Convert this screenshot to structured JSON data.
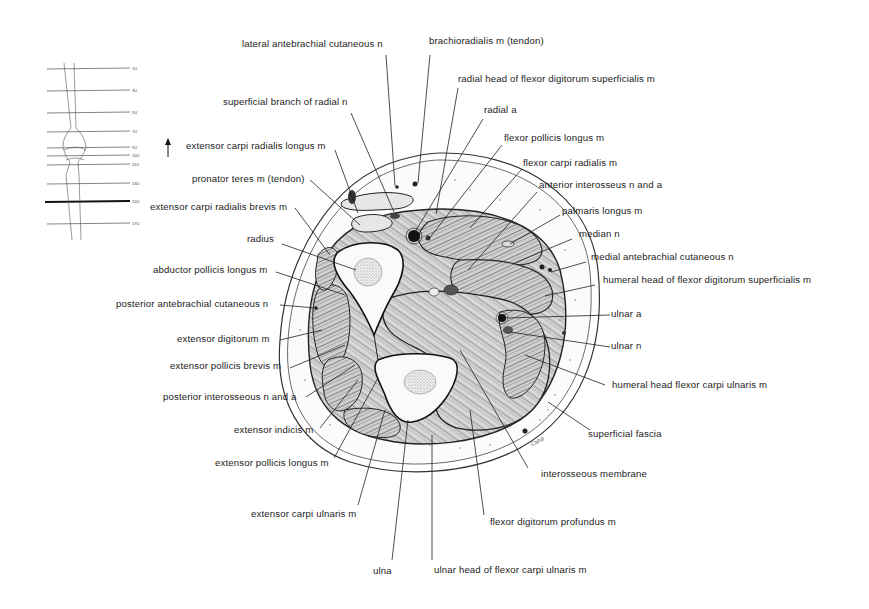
{
  "figure": {
    "type": "anatomical cross-section",
    "signature": "Cahill"
  },
  "orientation_thumbnail": {
    "levels": [
      "1U",
      "3U",
      "5U",
      "7U",
      "9U",
      "10U",
      "11U",
      "13U",
      "15U",
      "17U"
    ],
    "highlighted_level": "15U",
    "arrow": "up-arrow"
  },
  "labels": {
    "top": [
      {
        "text": "lateral antebrachial cutaneous n"
      },
      {
        "text": "brachioradialis m (tendon)"
      },
      {
        "text": "radial head of flexor digitorum superficialis m"
      },
      {
        "text": "superficial branch of radial n"
      },
      {
        "text": "radial a"
      }
    ],
    "right": [
      {
        "text": "flexor pollicis longus m"
      },
      {
        "text": "flexor carpi radialis m"
      },
      {
        "text": "anterior interosseus n and a"
      },
      {
        "text": "palmaris longus m"
      },
      {
        "text": "median n"
      },
      {
        "text": "medial antebrachial cutaneous n"
      },
      {
        "text": "humeral head of flexor digitorum superficialis m"
      },
      {
        "text": "ulnar a"
      },
      {
        "text": "ulnar n"
      },
      {
        "text": "humeral head flexor carpi ulnaris m"
      },
      {
        "text": "superficial fascia"
      },
      {
        "text": "interosseous membrane"
      }
    ],
    "left": [
      {
        "text": "extensor carpi radialis longus m"
      },
      {
        "text": "pronator teres m (tendon)"
      },
      {
        "text": "extensor carpi radialis brevis m"
      },
      {
        "text": "radius"
      },
      {
        "text": "abductor pollicis longus m"
      },
      {
        "text": "posterior antebrachial cutaneous n"
      },
      {
        "text": "extensor digitorum m"
      },
      {
        "text": "extensor pollicis brevis m"
      },
      {
        "text": "posterior interosseous n and a"
      },
      {
        "text": "extensor indicis m"
      },
      {
        "text": "extensor pollicis longus m"
      }
    ],
    "bottom": [
      {
        "text": "extensor carpi ulnaris m"
      },
      {
        "text": "flexor digitorum profundus m"
      },
      {
        "text": "ulna"
      },
      {
        "text": "ulnar head of flexor carpi ulnaris m"
      }
    ]
  }
}
